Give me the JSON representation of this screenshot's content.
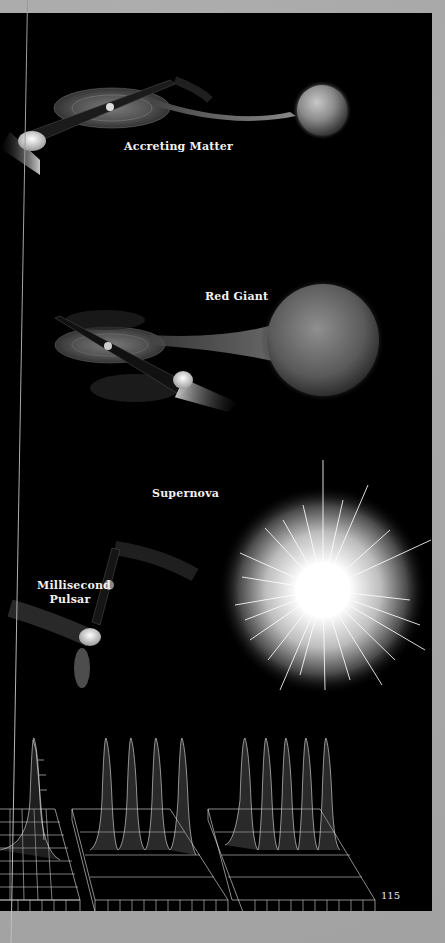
{
  "page": {
    "number": "115",
    "colors": {
      "paper": "#a8a8a8",
      "panel": "#000000",
      "label": "#f2f2f2"
    }
  },
  "illustrations": [
    {
      "id": "accreting-matter",
      "label": "Accreting Matter",
      "description": "Neutron star with accretion disk and beams, drawing matter from companion star"
    },
    {
      "id": "red-giant",
      "label": "Red Giant",
      "description": "Neutron star with accretion disk drawing matter from a large red giant companion"
    },
    {
      "id": "supernova",
      "label": "Supernova",
      "description": "Bright starburst explosion"
    },
    {
      "id": "millisecond-pulsar",
      "label_line1": "Millisecond",
      "label_line2": "Pulsar",
      "description": "Spinning neutron star emitting beams"
    }
  ],
  "pulse_plots": [
    {
      "id": "pulse-plot-1",
      "peaks": 1
    },
    {
      "id": "pulse-plot-2",
      "peaks": 4
    },
    {
      "id": "pulse-plot-3",
      "peaks": 5
    }
  ]
}
